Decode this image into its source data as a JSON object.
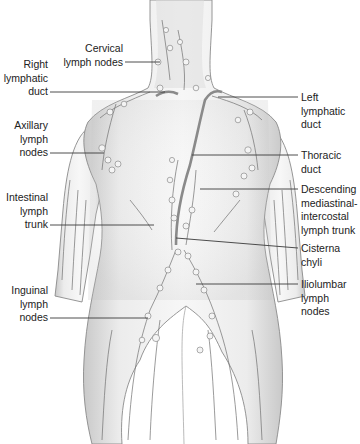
{
  "figure": {
    "colors": {
      "background": "#ffffff",
      "skin_light": "#f2f2f2",
      "skin_shade": "#c8c8c8",
      "outline": "#8a8a8a",
      "leader_line": "#3a3a3a",
      "label_text": "#222222"
    }
  },
  "labels": {
    "cervical": "Cervical\nlymph nodes",
    "right_lymphatic_duct": "Right\nlymphatic\nduct",
    "axillary": "Axillary\nlymph\nnodes",
    "intestinal": "Intestinal\nlymph\ntrunk",
    "inguinal": "Inguinal\nlymph\nnodes",
    "left_lymphatic_duct": "Left\nlymphatic\nduct",
    "thoracic_duct": "Thoracic\nduct",
    "descending": "Descending\nmediastinal-\nintercostal\nlymph trunk",
    "cisterna_chyli": "Cisterna\nchyli",
    "iliolumbar": "Iliolumbar\nlymph\nnodes"
  }
}
